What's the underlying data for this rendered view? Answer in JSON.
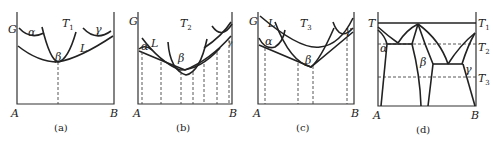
{
  "figure": {
    "panels": [
      {
        "id": "a",
        "caption": "(a)",
        "y_axis_label": "G",
        "temperature_label": "T",
        "temperature_sub": "1",
        "x_left": "A",
        "x_right": "B",
        "phase_labels": [
          "α",
          "β",
          "γ",
          "L"
        ]
      },
      {
        "id": "b",
        "caption": "(b)",
        "y_axis_label": "G",
        "temperature_label": "T",
        "temperature_sub": "2",
        "x_left": "A",
        "x_right": "B",
        "phase_labels": [
          "α",
          "L",
          "β",
          "γ"
        ]
      },
      {
        "id": "c",
        "caption": "(c)",
        "y_axis_label": "G",
        "temperature_label": "T",
        "temperature_sub": "3",
        "x_left": "A",
        "x_right": "B",
        "phase_labels": [
          "L",
          "α",
          "β",
          "γ"
        ]
      },
      {
        "id": "d",
        "caption": "(d)",
        "y_axis_label": "T",
        "x_left": "A",
        "x_right": "B",
        "isotherms": [
          {
            "label": "T",
            "sub": "1"
          },
          {
            "label": "T",
            "sub": "2"
          },
          {
            "label": "T",
            "sub": "3"
          }
        ],
        "phase_labels": [
          "α",
          "β",
          "γ"
        ]
      }
    ]
  }
}
